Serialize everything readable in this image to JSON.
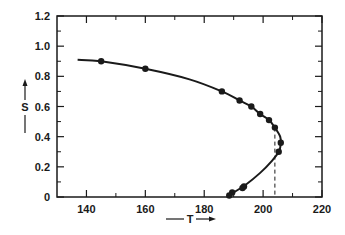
{
  "chart_data": {
    "type": "line",
    "title": "",
    "xlabel": "T",
    "ylabel": "S",
    "xlim": [
      130,
      220
    ],
    "ylim": [
      0,
      1.2
    ],
    "grid": false,
    "legend": null,
    "x_ticks": [
      140,
      160,
      180,
      200,
      220
    ],
    "x_minor_ticks": [
      150,
      170,
      190,
      210
    ],
    "y_ticks": [
      0,
      0.2,
      0.4,
      0.6,
      0.8,
      1.0,
      1.2
    ],
    "y_minor_ticks": [
      0.1,
      0.3,
      0.5,
      0.7,
      0.9,
      1.1
    ],
    "x_tick_labels": [
      "140",
      "160",
      "180",
      "200",
      "220"
    ],
    "y_tick_labels": [
      "0",
      "0.2",
      "0.4",
      "0.6",
      "0.8",
      "1.0",
      "1.2"
    ],
    "series": [
      {
        "name": "fitted curve",
        "style": "solid line",
        "points": [
          {
            "T": 137,
            "S": 0.91
          },
          {
            "T": 145,
            "S": 0.9
          },
          {
            "T": 160,
            "S": 0.85
          },
          {
            "T": 175,
            "S": 0.78
          },
          {
            "T": 186,
            "S": 0.7
          },
          {
            "T": 192,
            "S": 0.64
          },
          {
            "T": 196,
            "S": 0.6
          },
          {
            "T": 199,
            "S": 0.55
          },
          {
            "T": 202,
            "S": 0.51
          },
          {
            "T": 204,
            "S": 0.46
          },
          {
            "T": 205.8,
            "S": 0.4
          },
          {
            "T": 206,
            "S": 0.35
          },
          {
            "T": 205.3,
            "S": 0.3
          },
          {
            "T": 203,
            "S": 0.24
          },
          {
            "T": 199,
            "S": 0.16
          },
          {
            "T": 194,
            "S": 0.08
          },
          {
            "T": 190,
            "S": 0.03
          },
          {
            "T": 188,
            "S": 0.0
          }
        ]
      },
      {
        "name": "measured points",
        "style": "filled circles",
        "points": [
          {
            "T": 145,
            "S": 0.9
          },
          {
            "T": 160,
            "S": 0.85
          },
          {
            "T": 186,
            "S": 0.7
          },
          {
            "T": 192,
            "S": 0.64
          },
          {
            "T": 196,
            "S": 0.6
          },
          {
            "T": 199,
            "S": 0.55
          },
          {
            "T": 202,
            "S": 0.51
          },
          {
            "T": 204,
            "S": 0.46
          },
          {
            "T": 206,
            "S": 0.36
          },
          {
            "T": 205.3,
            "S": 0.3
          },
          {
            "T": 193.5,
            "S": 0.07
          },
          {
            "T": 193,
            "S": 0.06
          },
          {
            "T": 189.5,
            "S": 0.03
          },
          {
            "T": 188.5,
            "S": 0.01
          }
        ]
      }
    ],
    "annotations": [
      {
        "type": "dashed vertical line",
        "T": 204,
        "S_from": 0,
        "S_to": 0.46
      }
    ]
  },
  "axes": {
    "x_label": "T",
    "y_label": "S",
    "x_arrow": "right-arrow",
    "y_arrow": "up-arrow"
  }
}
